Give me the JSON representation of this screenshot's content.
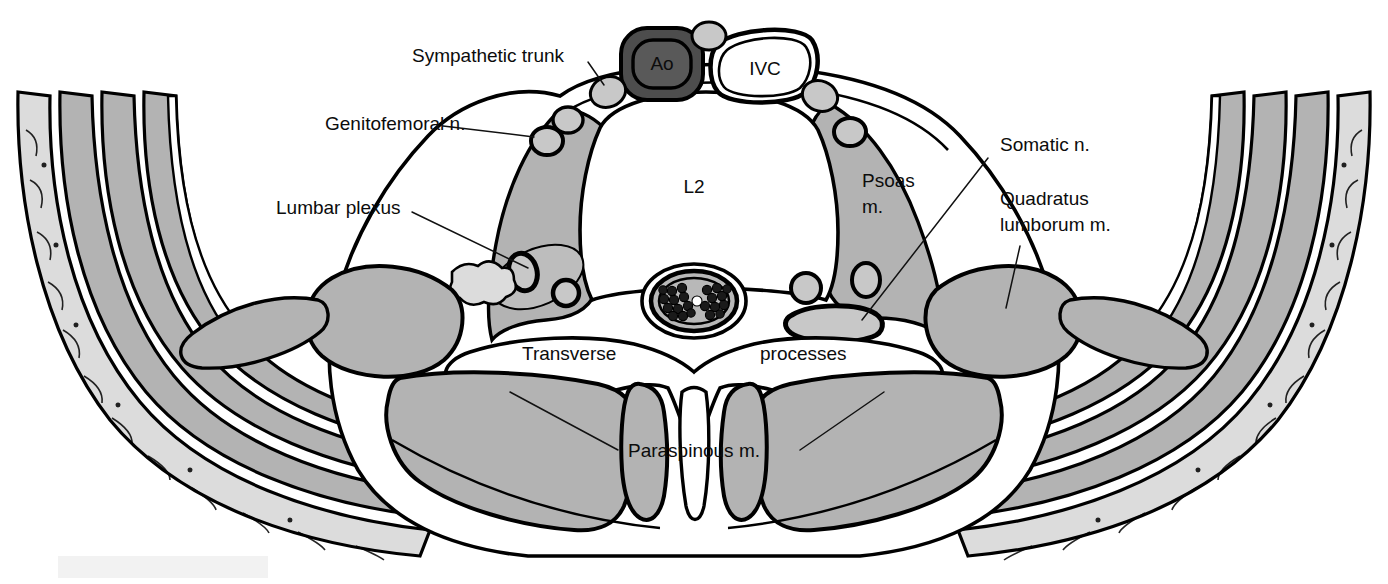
{
  "figure": {
    "background_color": "#ffffff"
  },
  "palette": {
    "muscle_gray": "#b3b3b3",
    "fat_gray": "#dcdcdc",
    "node_gray": "#c8c8c8",
    "aorta_gray": "#4d4d4d",
    "aorta_lumen": "#595959",
    "dural_sac_gray": "#b8b8b8",
    "nerve_root_dark": "#1a1a1a",
    "outline_black": "#000000",
    "white": "#ffffff"
  },
  "labels": {
    "sympathetic_trunk": "Sympathetic trunk",
    "genitofemoral_n": "Genitofemoral n.",
    "lumbar_plexus": "Lumbar plexus",
    "somatic_n": "Somatic n.",
    "quadratus_lumborum_line1": "Quadratus",
    "quadratus_lumborum_line2": "lumborum m.",
    "psoas_line1": "Psoas",
    "psoas_line2": "m.",
    "vertebral_body": "L2",
    "aorta": "Ao",
    "ivc": "IVC",
    "transverse": "Transverse",
    "processes": "processes",
    "paraspinous_m": "Paraspinous m."
  },
  "structures": [
    {
      "name": "vertebral-body-L2",
      "label": "L2",
      "fill": "white",
      "description": "central vertebral body"
    },
    {
      "name": "aorta",
      "label": "Ao",
      "fill": "dark-gray",
      "description": "abdominal aorta anterior-left of vertebral body"
    },
    {
      "name": "inferior-vena-cava",
      "label": "IVC",
      "fill": "white",
      "description": "inferior vena cava anterior-right of vertebral body"
    },
    {
      "name": "psoas-muscle",
      "label": "Psoas m.",
      "fill": "muscle-gray",
      "description": "bilateral psoas major muscles flanking the vertebral body"
    },
    {
      "name": "quadratus-lumborum-muscle",
      "label": "Quadratus lumborum m.",
      "fill": "muscle-gray",
      "description": "bilateral posterolateral muscle"
    },
    {
      "name": "paraspinous-muscle",
      "label": "Paraspinous m.",
      "fill": "muscle-gray",
      "description": "bilateral erector spinae muscle groups posterior to transverse processes"
    },
    {
      "name": "transverse-process",
      "label": "Transverse processes",
      "fill": "white",
      "description": "bilateral bony lateral projections"
    },
    {
      "name": "spinous-process",
      "label": "",
      "fill": "white",
      "description": "posterior midline bony projection"
    },
    {
      "name": "dural-sac",
      "label": "",
      "fill": "gray-with-dark-roots",
      "description": "spinal canal containing cauda equina nerve roots"
    },
    {
      "name": "sympathetic-trunk-ganglion",
      "label": "Sympathetic trunk",
      "fill": "node-gray",
      "description": "small paired ganglia anterolateral to vertebral body"
    },
    {
      "name": "genitofemoral-nerve",
      "label": "Genitofemoral n.",
      "fill": "node-gray",
      "description": "nerve on anterior surface of psoas muscle"
    },
    {
      "name": "lumbar-plexus",
      "label": "Lumbar plexus",
      "fill": "node-gray",
      "description": "nerve bundles within posterior psoas muscle"
    },
    {
      "name": "somatic-nerve",
      "label": "Somatic n.",
      "fill": "node-gray",
      "description": "exiting nerve root lateral to the spinal canal"
    },
    {
      "name": "subcutaneous-fat",
      "label": "",
      "fill": "fat-gray",
      "description": "lobulated subcutaneous fat layer of the abdominal wall"
    },
    {
      "name": "abdominal-wall-muscle-layer",
      "label": "",
      "fill": "muscle-gray",
      "description": "three layered flank muscles: external oblique, internal oblique, transversus abdominis"
    }
  ]
}
